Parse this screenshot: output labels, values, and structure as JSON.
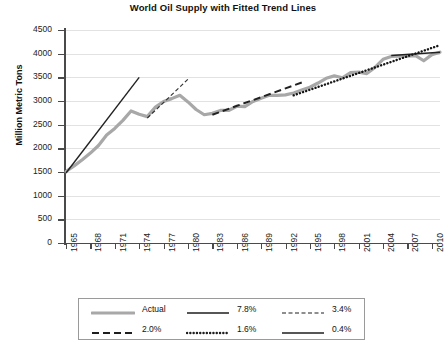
{
  "chart_data": {
    "type": "line",
    "title": "World Oil Supply with Fitted Trend Lines",
    "xlabel": "",
    "ylabel": "Million Metric Tons",
    "ylim": [
      0,
      4500
    ],
    "ytick_step": 500,
    "xlim": [
      1965,
      2011
    ],
    "grid": true,
    "legend_position": "bottom",
    "yticks": [
      "0",
      "500",
      "1000",
      "1500",
      "2000",
      "2500",
      "3000",
      "3500",
      "4000",
      "4500"
    ],
    "xticks": [
      "1965",
      "1968",
      "1971",
      "1974",
      "1977",
      "1980",
      "1983",
      "1986",
      "1989",
      "1992",
      "1995",
      "1998",
      "2001",
      "2004",
      "2007",
      "2010"
    ],
    "series": [
      {
        "name": "Actual",
        "style": "solid-thick-gray",
        "color": "#a8a8a8",
        "x": [
          1965,
          1966,
          1967,
          1968,
          1969,
          1970,
          1971,
          1972,
          1973,
          1974,
          1975,
          1976,
          1977,
          1978,
          1979,
          1980,
          1981,
          1982,
          1983,
          1984,
          1985,
          1986,
          1987,
          1988,
          1989,
          1990,
          1991,
          1992,
          1993,
          1994,
          1995,
          1996,
          1997,
          1998,
          1999,
          2000,
          2001,
          2002,
          2003,
          2004,
          2005,
          2006,
          2007,
          2008,
          2009,
          2010,
          2011
        ],
        "values": [
          1510,
          1630,
          1760,
          1900,
          2060,
          2280,
          2420,
          2590,
          2790,
          2720,
          2670,
          2870,
          2990,
          3050,
          3120,
          2980,
          2820,
          2710,
          2740,
          2800,
          2800,
          2890,
          2880,
          2990,
          3060,
          3120,
          3120,
          3130,
          3170,
          3230,
          3290,
          3380,
          3480,
          3530,
          3490,
          3600,
          3610,
          3580,
          3710,
          3880,
          3940,
          3950,
          3950,
          3960,
          3850,
          3980,
          4030
        ]
      },
      {
        "name": "7.8%",
        "style": "solid-thin-black",
        "color": "#222222",
        "x": [
          1965,
          1974
        ],
        "values": [
          1480,
          3500
        ]
      },
      {
        "name": "3.4%",
        "style": "fine-dashed",
        "color": "#333333",
        "x": [
          1975,
          1980
        ],
        "values": [
          2640,
          3460
        ]
      },
      {
        "name": "2.0%",
        "style": "long-dashed",
        "color": "#222222",
        "x": [
          1983,
          1994
        ],
        "values": [
          2710,
          3390
        ]
      },
      {
        "name": "1.6%",
        "style": "dotted",
        "color": "#151515",
        "x": [
          1993,
          2011
        ],
        "values": [
          3120,
          4180
        ]
      },
      {
        "name": "0.4%",
        "style": "solid-thin-black",
        "color": "#222222",
        "x": [
          2005,
          2011
        ],
        "values": [
          3960,
          4030
        ]
      }
    ]
  },
  "legend": {
    "rows": [
      [
        {
          "label": "Actual",
          "style": "solid-thick-gray"
        },
        {
          "label": "7.8%",
          "style": "solid-thin-black"
        },
        {
          "label": "3.4%",
          "style": "fine-dashed"
        }
      ],
      [
        {
          "label": "2.0%",
          "style": "long-dashed"
        },
        {
          "label": "1.6%",
          "style": "dotted"
        },
        {
          "label": "0.4%",
          "style": "solid-thin-black"
        }
      ]
    ]
  }
}
